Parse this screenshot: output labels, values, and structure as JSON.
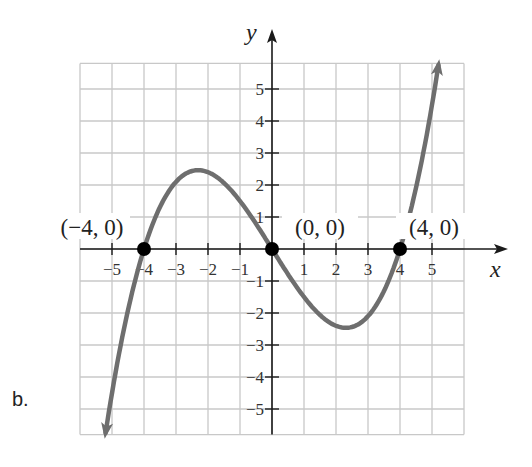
{
  "part_label": "b.",
  "chart_data": {
    "type": "line",
    "title": "",
    "xlabel": "x",
    "ylabel": "y",
    "xlim": [
      -6,
      6
    ],
    "ylim": [
      -5.8,
      5.8
    ],
    "grid": true,
    "x_ticks": [
      -5,
      -4,
      -3,
      -2,
      -1,
      1,
      2,
      3,
      4,
      5
    ],
    "x_tick_labels": [
      "−5",
      "−4",
      "−3",
      "−2",
      "−1",
      "1",
      "2",
      "3",
      "4",
      "5"
    ],
    "y_ticks": [
      -5,
      -4,
      -3,
      -2,
      -1,
      1,
      2,
      3,
      4,
      5
    ],
    "y_tick_labels": [
      "−5",
      "−4",
      "−3",
      "−2",
      "−1",
      "1",
      "2",
      "3",
      "4",
      "5"
    ],
    "function": "y = 0.1·x(x+4)(x−4)",
    "domain_shown": [
      -5.2,
      5.2
    ],
    "ends_with_arrows": true,
    "series": [
      {
        "name": "cubic curve",
        "color": "#6e6e6e",
        "x": [
          -5.2,
          -5,
          -4.5,
          -4,
          -3.5,
          -3,
          -2.5,
          -2.31,
          -2,
          -1.5,
          -1,
          -0.5,
          0,
          0.5,
          1,
          1.5,
          2,
          2.31,
          2.5,
          3,
          3.5,
          4,
          4.5,
          5,
          5.2
        ],
        "y": [
          -5.74,
          -4.5,
          -1.91,
          0,
          1.31,
          2.1,
          2.44,
          2.46,
          2.4,
          2.06,
          1.5,
          0.79,
          0,
          -0.79,
          -1.5,
          -2.06,
          -2.4,
          -2.46,
          -2.44,
          -2.1,
          -1.31,
          0,
          1.91,
          4.5,
          5.74
        ]
      }
    ],
    "points": [
      {
        "x": -4,
        "y": 0,
        "label": "(−4, 0)"
      },
      {
        "x": 0,
        "y": 0,
        "label": "(0, 0)"
      },
      {
        "x": 4,
        "y": 0,
        "label": "(4, 0)"
      }
    ],
    "colors": {
      "grid": "#c8c8c8",
      "axis": "#1a1a1a",
      "curve": "#6e6e6e",
      "point": "#000000"
    }
  }
}
